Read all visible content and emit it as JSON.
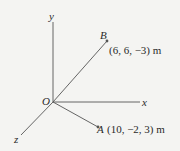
{
  "diagram": {
    "type": "3d-coordinate-vectors",
    "colors": {
      "background": "#f4f4f2",
      "line": "#555555",
      "text": "#2a2a2a"
    },
    "axes": {
      "x": {
        "label": "x"
      },
      "y": {
        "label": "y"
      },
      "z": {
        "label": "z"
      }
    },
    "origin": {
      "label": "O"
    },
    "points": {
      "B": {
        "label": "B",
        "coords": "(6, 6, −3) m"
      },
      "A": {
        "label": "A",
        "coords": "(10, −2, 3) m"
      }
    }
  }
}
